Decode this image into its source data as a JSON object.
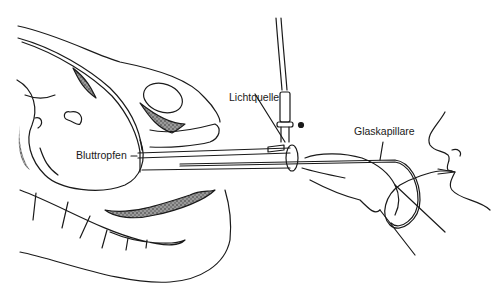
{
  "figure": {
    "labels": {
      "light_source": "Lichtquelle",
      "glass_capillary": "Glaskapillare",
      "blood_drop": "Bluttropfen"
    },
    "colors": {
      "line": "#1a1a1a",
      "shading": "#555555",
      "background": "#ffffff"
    }
  }
}
